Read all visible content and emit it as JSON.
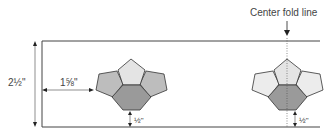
{
  "title": "Center fold line",
  "dimensions": {
    "height": "2½\"",
    "left_offset": "1⅝\"",
    "bottom_left": "½\"",
    "bottom_right": "½\""
  },
  "colors": {
    "top_pentagon": "#e4e4e4",
    "side_pentagon_left": "#bdbdbd",
    "side_pentagon_right": "#ececec",
    "hexagon": "#9a9a9a",
    "line": "#444444"
  }
}
